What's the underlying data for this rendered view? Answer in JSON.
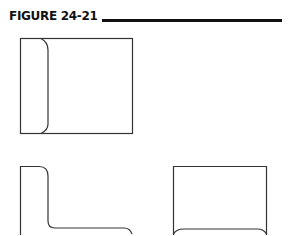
{
  "figure": {
    "label": "FIGURE 24-21",
    "rule_color": "#111111",
    "line_color": "#333333"
  },
  "shapes": [
    {
      "name": "flap-pocket-box",
      "description": "Square box with rounded inner flap on left side"
    },
    {
      "name": "l-shaped-profile",
      "description": "L-shaped outline with rounded corners"
    },
    {
      "name": "open-bottom-box",
      "description": "Rectangle with rounded bottom corners curving inward"
    }
  ]
}
